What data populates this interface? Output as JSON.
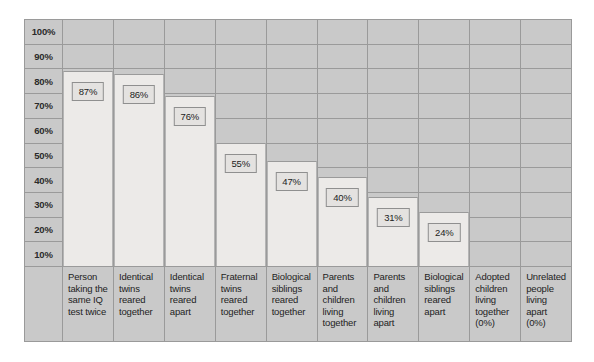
{
  "chart_data": {
    "type": "bar",
    "title": "",
    "xlabel": "",
    "ylabel": "",
    "ylim": [
      0,
      100
    ],
    "grid": true,
    "legend": "none",
    "y_ticks": [
      "100%",
      "90%",
      "80%",
      "70%",
      "60%",
      "50%",
      "40%",
      "30%",
      "20%",
      "10%"
    ],
    "categories": [
      "Person taking the same IQ test twice",
      "Identical twins reared together",
      "Identical twins reared apart",
      "Fraternal twins reared together",
      "Biological siblings reared together",
      "Parents and children living together",
      "Parents and children living apart",
      "Biological siblings reared apart",
      "Adopted children living together (0%)",
      "Unrelated people living apart (0%)"
    ],
    "values": [
      87,
      86,
      76,
      55,
      47,
      40,
      31,
      24,
      0,
      0
    ],
    "value_labels": [
      "87%",
      "86%",
      "76%",
      "55%",
      "47%",
      "40%",
      "31%",
      "24%",
      "",
      ""
    ],
    "colors": {
      "bar_fill": "#eceae8",
      "plot_background": "#c9c9c9",
      "grid_line": "#9a9a9a",
      "label_box_fill": "#e4e2e0",
      "text": "#232323"
    }
  }
}
